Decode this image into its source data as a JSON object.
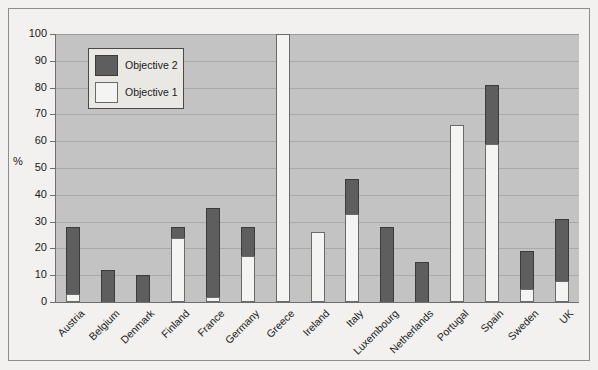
{
  "chart_data": {
    "type": "bar",
    "subtype": "stacked",
    "title": "",
    "xlabel": "",
    "ylabel": "%",
    "ylim": [
      0,
      100
    ],
    "yticks": [
      0,
      10,
      20,
      30,
      40,
      50,
      60,
      70,
      80,
      90,
      100
    ],
    "ytick_labels": [
      "0",
      "10",
      "20",
      "30",
      "40",
      "50",
      "60",
      "70",
      "80",
      "90",
      "100"
    ],
    "grid": true,
    "legend_position": "upper-left-inside",
    "categories": [
      "Austria",
      "Belgium",
      "Denmark",
      "Finland",
      "France",
      "Germany",
      "Greece",
      "Ireland",
      "Italy",
      "Luxembourg",
      "Netherlands",
      "Portugal",
      "Spain",
      "Sweden",
      "UK"
    ],
    "series": [
      {
        "name": "Objective 1",
        "color": "#f4f4f2",
        "values": [
          3,
          0,
          0,
          24,
          2,
          17,
          100,
          26,
          33,
          0,
          0,
          66,
          59,
          5,
          8
        ]
      },
      {
        "name": "Objective 2",
        "color": "#5e5e5e",
        "values": [
          25,
          12,
          10,
          4,
          33,
          11,
          0,
          0,
          13,
          28,
          15,
          0,
          22,
          14,
          23
        ]
      }
    ],
    "totals": [
      28,
      12,
      10,
      28,
      35,
      28,
      100,
      26,
      46,
      28,
      15,
      66,
      81,
      19,
      31
    ]
  },
  "legend": {
    "entries": [
      {
        "label": "Objective 2",
        "color": "#5e5e5e"
      },
      {
        "label": "Objective 1",
        "color": "#f4f4f2"
      }
    ]
  },
  "axis": {
    "y_axis_title": "%"
  }
}
